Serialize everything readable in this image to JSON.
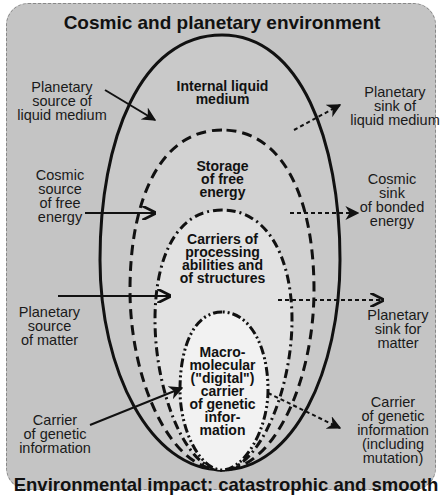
{
  "figure": {
    "top_title": "Cosmic and planetary environment",
    "bottom_title": "Environmental  impact: catastrophic and smooth"
  },
  "layers": [
    {
      "name": "Internal liquid\nmedium",
      "border": "solid"
    },
    {
      "name": "Storage\nof free\nenergy",
      "border": "dashed"
    },
    {
      "name": "Carriers of\nprocessing\nabilities and\nof structures",
      "border": "dash-dot"
    },
    {
      "name": "Macro-\nmolecular\n(\"digital\")\ncarrier\nof genetic\ninfor-\nmation",
      "border": "dash-dot-dot"
    }
  ],
  "sources": [
    {
      "label": "Planetary\nsource of\nliquid medium",
      "arrow": "solid"
    },
    {
      "label": "Cosmic\nsource\nof free\nenergy",
      "arrow": "solid"
    },
    {
      "label": "Planetary\nsource\nof matter",
      "arrow": "solid"
    },
    {
      "label": "Carrier\nof genetic\ninformation",
      "arrow": "solid"
    }
  ],
  "sinks": [
    {
      "label": "Planetary\nsink of\nliquid medium",
      "arrow": "dashed"
    },
    {
      "label": "Cosmic\nsink\nof bonded\nenergy",
      "arrow": "dashed"
    },
    {
      "label": "Planetary\nsink for\nmatter",
      "arrow": "dashed"
    },
    {
      "label": "Carrier\nof genetic\ninformation\n(including\nmutation)",
      "arrow": "dashed"
    }
  ],
  "colors": {
    "background": "#c4c4c4",
    "inner_fill": "#e6e6e6",
    "core_fill": "#f2f2f2",
    "ink": "#111111"
  }
}
